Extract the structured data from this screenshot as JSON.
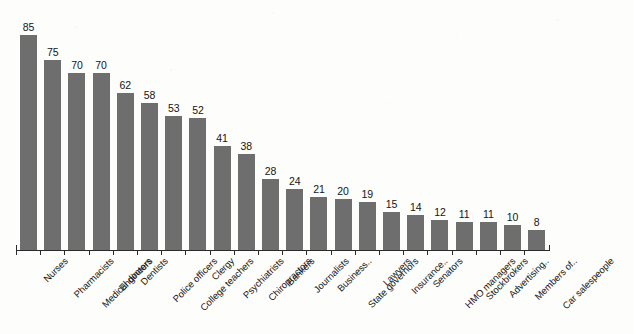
{
  "chart_data": {
    "type": "bar",
    "title": "",
    "subtitle": "",
    "xlabel": "",
    "ylabel": "",
    "ylim": [
      0,
      90
    ],
    "grid": false,
    "legend": null,
    "orientation": "vertical",
    "bar_color": "#6e6e6e",
    "axis_color": "#2b2b2b",
    "background_color": "#fdfdfc",
    "categories": [
      "Nurses",
      "Pharmacists",
      "Medical doctors",
      "Engineers",
      "Dentists",
      "Police officers",
      "College teachers",
      "Clergy",
      "Psychiatrists",
      "Chiropractors",
      "Bankers",
      "Journalists",
      "Business..",
      "State governors",
      "Lawyers",
      "Insurance..",
      "Senators",
      "HMO managers",
      "Stockbrokers",
      "Advertising..",
      "Members of..",
      "Car salespeople"
    ],
    "values": [
      85,
      75,
      70,
      70,
      62,
      58,
      53,
      52,
      41,
      38,
      28,
      24,
      21,
      20,
      19,
      15,
      14,
      12,
      11,
      11,
      10,
      8
    ],
    "data_labels": [
      "85",
      "75",
      "70",
      "70",
      "62",
      "58",
      "53",
      "52",
      "41",
      "38",
      "28",
      "24",
      "21",
      "20",
      "19",
      "15",
      "14",
      "12",
      "11",
      "11",
      "10",
      "8"
    ]
  }
}
